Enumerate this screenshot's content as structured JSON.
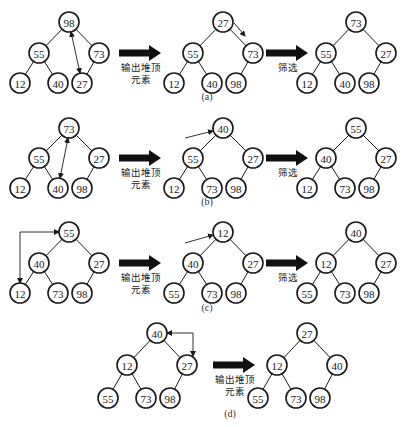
{
  "figure": {
    "labels": {
      "output_top_line1": "输出堆顶",
      "output_top_line2": "元素",
      "sift": "筛选"
    },
    "captions": [
      "(a)",
      "(b)",
      "(c)",
      "(d)"
    ],
    "rows": [
      {
        "caption": "(a)",
        "trees": [
          {
            "root": "98",
            "l": "55",
            "r": "73",
            "ll": "12",
            "lr": "40",
            "rl": "27",
            "note": "swap 98 with 27"
          },
          {
            "root": "27",
            "l": "55",
            "r": "73",
            "ll": "12",
            "lr": "40",
            "rl": "98",
            "note": "sift 27 toward 73"
          },
          {
            "root": "73",
            "l": "55",
            "r": "27",
            "ll": "12",
            "lr": "40",
            "rl": "98"
          }
        ],
        "arrows": [
          "输出堆顶元素",
          "筛选"
        ]
      },
      {
        "caption": "(b)",
        "trees": [
          {
            "root": "73",
            "l": "55",
            "r": "27",
            "ll": "12",
            "lr": "40",
            "rl": "98",
            "note": "swap 73 with 40"
          },
          {
            "root": "40",
            "l": "55",
            "r": "27",
            "ll": "12",
            "lr": "73",
            "rl": "98",
            "note": "55 moves up"
          },
          {
            "root": "55",
            "l": "40",
            "r": "27",
            "ll": "12",
            "lr": "73",
            "rl": "98"
          }
        ],
        "arrows": [
          "输出堆顶元素",
          "筛选"
        ]
      },
      {
        "caption": "(c)",
        "trees": [
          {
            "root": "55",
            "l": "40",
            "r": "27",
            "ll": "12",
            "lr": "73",
            "rl": "98",
            "note": "swap 55 with 12"
          },
          {
            "root": "12",
            "l": "40",
            "r": "27",
            "ll": "55",
            "lr": "73",
            "rl": "98",
            "note": "40 moves up"
          },
          {
            "root": "40",
            "l": "12",
            "r": "27",
            "ll": "55",
            "lr": "73",
            "rl": "98"
          }
        ],
        "arrows": [
          "输出堆顶元素",
          "筛选"
        ]
      },
      {
        "caption": "(d)",
        "trees": [
          {
            "root": "40",
            "l": "12",
            "r": "27",
            "ll": "55",
            "lr": "73",
            "rl": "98",
            "note": "swap 40 with 27"
          },
          {
            "root": "27",
            "l": "12",
            "r": "40",
            "ll": "55",
            "lr": "73",
            "rl": "98"
          }
        ],
        "arrows": [
          "输出堆顶元素"
        ]
      }
    ]
  }
}
